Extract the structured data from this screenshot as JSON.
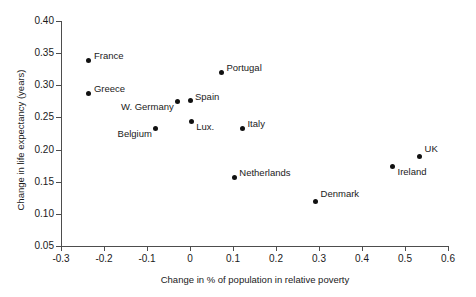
{
  "chart_data": {
    "type": "scatter",
    "title": "",
    "xlabel": "Change in % of population in relative poverty",
    "ylabel": "Change in life expectancy (years)",
    "xlim": [
      -0.3,
      0.6
    ],
    "ylim": [
      0.05,
      0.4
    ],
    "xticks": [
      "-0.3",
      "-0.2",
      "-0.1",
      "0",
      "0.1",
      "0.2",
      "0.3",
      "0.4",
      "0.5",
      "0.6"
    ],
    "xtick_values": [
      -0.3,
      -0.2,
      -0.1,
      0,
      0.1,
      0.2,
      0.3,
      0.4,
      0.5,
      0.6
    ],
    "yticks": [
      "0.05",
      "0.10",
      "0.15",
      "0.20",
      "0.25",
      "0.30",
      "0.35",
      "0.40"
    ],
    "ytick_values": [
      0.05,
      0.1,
      0.15,
      0.2,
      0.25,
      0.3,
      0.35,
      0.4
    ],
    "grid": false,
    "legend": "none",
    "marker_color": "#111111",
    "axis_color": "#4d4d4d",
    "points": [
      {
        "label": "France",
        "x": -0.235,
        "y": 0.339,
        "label_pos": "right"
      },
      {
        "label": "Greece",
        "x": -0.235,
        "y": 0.288,
        "label_pos": "right"
      },
      {
        "label": "Belgium",
        "x": -0.08,
        "y": 0.233,
        "label_pos": "below-left"
      },
      {
        "label": "W. Germany",
        "x": -0.028,
        "y": 0.275,
        "label_pos": "below-left"
      },
      {
        "label": "Spain",
        "x": 0.0,
        "y": 0.276,
        "label_pos": "right"
      },
      {
        "label": "Lux.",
        "x": 0.003,
        "y": 0.244,
        "label_pos": "below-right"
      },
      {
        "label": "Portugal",
        "x": 0.073,
        "y": 0.32,
        "label_pos": "right"
      },
      {
        "label": "Italy",
        "x": 0.122,
        "y": 0.233,
        "label_pos": "right"
      },
      {
        "label": "Netherlands",
        "x": 0.103,
        "y": 0.157,
        "label_pos": "right"
      },
      {
        "label": "Denmark",
        "x": 0.292,
        "y": 0.12,
        "label_pos": "above-right"
      },
      {
        "label": "Ireland",
        "x": 0.471,
        "y": 0.174,
        "label_pos": "below-right"
      },
      {
        "label": "UK",
        "x": 0.534,
        "y": 0.19,
        "label_pos": "above-right"
      }
    ]
  }
}
